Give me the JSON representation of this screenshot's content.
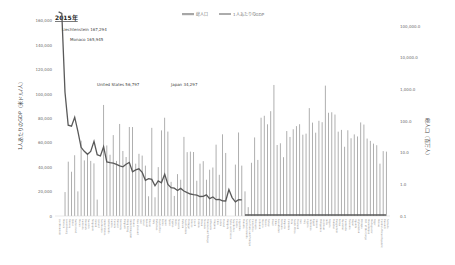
{
  "chart_data": {
    "type": "bar+line",
    "title": "2015年",
    "legend": [
      {
        "label": "総人口",
        "type": "bar",
        "color": "#a6a6a6"
      },
      {
        "label": "1人あたりのGDP",
        "type": "line",
        "color": "#595959"
      }
    ],
    "legend_position": "top",
    "ylabel_left": "1人あたりのGDP（米ドル/人）",
    "ylabel_right": "総人口（百万人）",
    "yticks_left": [
      "0",
      "20,000",
      "40,000",
      "60,000",
      "80,000",
      "100,000",
      "120,000",
      "140,000",
      "160,000",
      "180,000"
    ],
    "ylim_left": [
      0,
      180000
    ],
    "yticks_right": [
      "0.1",
      "1.0",
      "10.0",
      "100.0",
      "1,000.0",
      "10,000.0",
      "100,000.0"
    ],
    "ylim_right": [
      0.1,
      100000
    ],
    "right_axis_scale": "log",
    "grid": false,
    "annotations": [
      {
        "text": "Liechtenstein 167,294",
        "x_index": 0
      },
      {
        "text": "Monaco 165,945",
        "x_index": 1
      },
      {
        "text": "United States 56,797",
        "x_index": 14
      },
      {
        "text": "Japan 34,297",
        "x_index": 33
      }
    ],
    "categories": [
      "Liechtenstein",
      "Monaco",
      "Luxembourg",
      "Norway",
      "Qatar",
      "Switzerland",
      "Macao",
      "Australia",
      "Denmark",
      "Sweden",
      "Singapore",
      "Ireland",
      "Iceland",
      "San Marino",
      "United States",
      "Netherlands",
      "Austria",
      "Canada",
      "Finland",
      "Germany",
      "Belgium",
      "Hong Kong",
      "United Kingdom",
      "France",
      "New Zealand",
      "UAE",
      "Israel",
      "Kuwait",
      "Brunei",
      "Italy",
      "Bahamas",
      "Puerto Rico",
      "Korea",
      "Japan",
      "Spain",
      "Cyprus",
      "Malta",
      "Slovenia",
      "Bahrain",
      "Saudi Arabia",
      "Portugal",
      "Greece",
      "Czech",
      "Estonia",
      "Oman",
      "Slovakia",
      "Trinidad and Tobago",
      "Lithuania",
      "Uruguay",
      "Chile",
      "Latvia",
      "Poland",
      "Hungary",
      "Turks and Caicos",
      "Seychelles",
      "Croatia",
      "Argentina",
      "Panama",
      "Solomon Islands",
      "San Tome and Principe",
      "Costa Rica",
      "Malaysia",
      "Lebanon",
      "Mexico",
      "Russia",
      "Turkey",
      "Brazil",
      "China",
      "Kazakhstan",
      "Romania",
      "Bulgaria",
      "Colombia",
      "Peru",
      "South Africa",
      "Thailand",
      "Iran",
      "Iraq",
      "Algeria",
      "Indonesia",
      "Egypt",
      "Ukraine",
      "Philippines",
      "Viet Nam",
      "India",
      "Nigeria",
      "Pakistan",
      "Bangladesh",
      "Kenya",
      "Myanmar",
      "Cambodia",
      "Tanzania",
      "Nepal",
      "Uganda",
      "Afghanistan",
      "Ethiopia",
      "D.R. of the Congo",
      "Mozambique",
      "Madagascar",
      "Niger",
      "Malawi",
      "Central African Republic",
      "Burundi",
      "Somalia"
    ],
    "series": [
      {
        "name": "1人あたりのGDP",
        "axis": "left",
        "values": [
          167294,
          165945,
          101450,
          74400,
          73650,
          80990,
          69370,
          56330,
          53020,
          50580,
          52890,
          61130,
          50280,
          49140,
          56797,
          44300,
          43720,
          43250,
          42410,
          41180,
          40320,
          42430,
          43930,
          36350,
          37810,
          38650,
          35740,
          29300,
          30670,
          29960,
          24750,
          28740,
          27220,
          34297,
          25830,
          23260,
          22820,
          20870,
          22600,
          20480,
          19220,
          18000,
          17550,
          17110,
          15960,
          16090,
          17320,
          14250,
          15560,
          13340,
          13620,
          12480,
          12260,
          21720,
          15080,
          11580,
          13430,
          13270,
          1930,
          1690,
          11260,
          9500,
          8470,
          9010,
          9060,
          9130,
          8670,
          8030,
          10510,
          8970,
          6820,
          6050,
          6030,
          5720,
          5810,
          5000,
          4700,
          4150,
          3350,
          3620,
          2120,
          2900,
          2110,
          1600,
          2730,
          1440,
          1210,
          1380,
          1190,
          1160,
          880,
          740,
          690,
          600,
          620,
          450,
          530,
          410,
          380,
          360,
          360,
          270,
          400
        ]
      },
      {
        "name": "総人口",
        "axis": "right",
        "values": [
          0.04,
          0.04,
          0.57,
          5.2,
          2.5,
          8.3,
          0.6,
          23.8,
          5.7,
          9.8,
          5.5,
          4.6,
          0.33,
          0.03,
          321.4,
          16.9,
          8.6,
          35.9,
          5.5,
          80.7,
          11.3,
          7.3,
          64.7,
          64.4,
          4.5,
          9.2,
          8.1,
          3.9,
          0.42,
          60.8,
          0.39,
          3.5,
          50.6,
          126.9,
          46.4,
          1.2,
          0.43,
          2.1,
          1.4,
          31.5,
          10.4,
          10.8,
          10.5,
          1.3,
          4.5,
          5.4,
          1.4,
          2.9,
          3.4,
          17.9,
          2.0,
          38.0,
          9.8,
          0.03,
          0.1,
          4.2,
          43.4,
          3.9,
          0.6,
          0.19,
          4.8,
          30.3,
          5.9,
          127.0,
          146.3,
          78.7,
          204.5,
          1374.6,
          17.5,
          19.8,
          7.2,
          48.2,
          31.4,
          54.9,
          68.9,
          79.1,
          36.9,
          39.9,
          255.5,
          88.9,
          42.8,
          101.6,
          91.7,
          1311.1,
          182.2,
          188.9,
          160.0,
          46.1,
          52.4,
          15.4,
          51.0,
          28.5,
          37.8,
          32.5,
          90.1,
          77.3,
          27.9,
          23.6,
          19.3,
          17.2,
          4.5,
          11.2,
          10.8
        ]
      }
    ]
  },
  "legend": {
    "bar_label": "総人口",
    "line_label": "1人あたりのGDP"
  },
  "title": "2015年",
  "axes": {
    "left_title": "1人あたりのGDP（米ドル/人）",
    "right_title": "総人口（百万人）"
  }
}
